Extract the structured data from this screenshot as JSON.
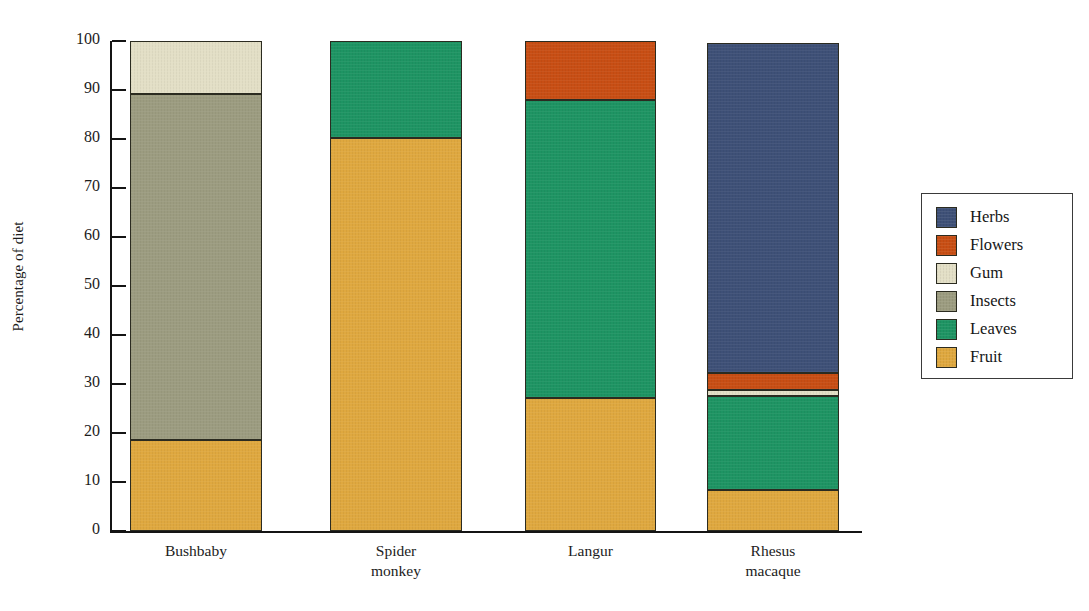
{
  "chart_data": {
    "type": "bar",
    "stacked": true,
    "title": "",
    "xlabel": "",
    "ylabel": "Percentage of diet",
    "ylim": [
      0,
      100
    ],
    "yticks": [
      0,
      10,
      20,
      30,
      40,
      50,
      60,
      70,
      80,
      90,
      100
    ],
    "ytick_labels": [
      "0",
      "10",
      "20",
      "30",
      "40",
      "50",
      "60",
      "70",
      "80",
      "90",
      "100"
    ],
    "grid": false,
    "legend_position": "right",
    "categories": [
      "Bushbaby",
      "Spider monkey",
      "Langur",
      "Rhesus macaque"
    ],
    "category_lines": [
      [
        "Bushbaby"
      ],
      [
        "Spider",
        "monkey"
      ],
      [
        "Langur"
      ],
      [
        "Rhesus",
        "macaque"
      ]
    ],
    "series": [
      {
        "name": "Fruit",
        "color": "#dfa83f",
        "values": [
          18.5,
          80.3,
          27.2,
          8.4
        ]
      },
      {
        "name": "Leaves",
        "color": "#1e9463",
        "values": [
          0,
          19.7,
          60.8,
          19.1
        ]
      },
      {
        "name": "Insects",
        "color": "#9c9c80",
        "values": [
          70.6,
          0,
          0,
          0
        ]
      },
      {
        "name": "Gum",
        "color": "#e3dfc6",
        "values": [
          10.9,
          0,
          0,
          1.3
        ]
      },
      {
        "name": "Flowers",
        "color": "#c84e14",
        "values": [
          0,
          0,
          12.0,
          3.5
        ]
      },
      {
        "name": "Herbs",
        "color": "#3e5077",
        "values": [
          0,
          0,
          0,
          67.2
        ]
      }
    ],
    "stack_order_bottom_to_top": [
      "Fruit",
      "Leaves",
      "Insects",
      "Gum",
      "Flowers",
      "Herbs"
    ]
  },
  "legend": {
    "entries": [
      {
        "label": "Herbs",
        "color": "#3e5077"
      },
      {
        "label": "Flowers",
        "color": "#c84e14"
      },
      {
        "label": "Gum",
        "color": "#e3dfc6"
      },
      {
        "label": "Insects",
        "color": "#9c9c80"
      },
      {
        "label": "Leaves",
        "color": "#1e9463"
      },
      {
        "label": "Fruit",
        "color": "#dfa83f"
      }
    ]
  }
}
